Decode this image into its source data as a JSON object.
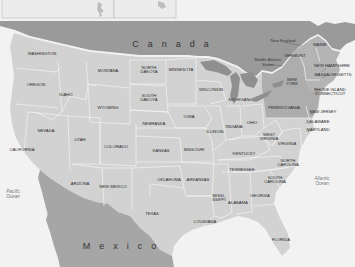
{
  "map": {
    "colors": {
      "water": "#f2f2f2",
      "canada": "#9a9a9a",
      "mexico": "#a6a6a6",
      "state": "#d2d2d2",
      "state_alt": "#c6c6c6",
      "new_england": "#b4b4b4",
      "middle_atlantic": "#adadad",
      "great_lakes": "#8f8f8f",
      "border": "#f4f4f4",
      "inset_bg": "#ececec",
      "inset_border": "#b8b8b8"
    },
    "countries": {
      "canada": "Canada",
      "mexico": "Mexico"
    },
    "oceans": {
      "pacific": "Pacific\nOcean",
      "atlantic": "Atlantic\nOcean"
    },
    "regions": {
      "new_england": "New England",
      "middle_atlantic": "Middle Atlantic\nStates"
    },
    "states": [
      {
        "name": "WASHINGTON",
        "x": 42,
        "y": 54
      },
      {
        "name": "OREGON",
        "x": 36,
        "y": 85
      },
      {
        "name": "IDAHO",
        "x": 66,
        "y": 95
      },
      {
        "name": "MONTANA",
        "x": 108,
        "y": 71
      },
      {
        "name": "WYOMING",
        "x": 108,
        "y": 108
      },
      {
        "name": "NEVADA",
        "x": 46,
        "y": 131
      },
      {
        "name": "UTAH",
        "x": 80,
        "y": 140
      },
      {
        "name": "COLORADO",
        "x": 116,
        "y": 147
      },
      {
        "name": "CALIFORNIA",
        "x": 22,
        "y": 150
      },
      {
        "name": "ARIZONA",
        "x": 80,
        "y": 184
      },
      {
        "name": "NEW MEXICO",
        "x": 113,
        "y": 187
      },
      {
        "name": "NORTH\nDAKOTA",
        "x": 149,
        "y": 70
      },
      {
        "name": "SOUTH\nDAKOTA",
        "x": 149,
        "y": 98
      },
      {
        "name": "NEBRASKA",
        "x": 154,
        "y": 124
      },
      {
        "name": "KANSAS",
        "x": 161,
        "y": 151
      },
      {
        "name": "OKLAHOMA",
        "x": 169,
        "y": 180
      },
      {
        "name": "TEXAS",
        "x": 152,
        "y": 214
      },
      {
        "name": "MINNESOTA",
        "x": 181,
        "y": 70
      },
      {
        "name": "IOWA",
        "x": 189,
        "y": 117
      },
      {
        "name": "MISSOURI",
        "x": 194,
        "y": 150
      },
      {
        "name": "ARKANSAS",
        "x": 198,
        "y": 180
      },
      {
        "name": "LOUISIANA",
        "x": 205,
        "y": 222
      },
      {
        "name": "WISCONSIN",
        "x": 211,
        "y": 90
      },
      {
        "name": "ILLINOIS",
        "x": 215,
        "y": 132
      },
      {
        "name": "MISSI-\nSSIPPI",
        "x": 219,
        "y": 198
      },
      {
        "name": "MICHIGAN",
        "x": 239,
        "y": 100
      },
      {
        "name": "INDIANA",
        "x": 234,
        "y": 127
      },
      {
        "name": "KENTUCKY",
        "x": 244,
        "y": 154
      },
      {
        "name": "TENNESSEE",
        "x": 242,
        "y": 170
      },
      {
        "name": "ALABAMA",
        "x": 238,
        "y": 203
      },
      {
        "name": "OHIO",
        "x": 252,
        "y": 123
      },
      {
        "name": "GEORGIA",
        "x": 260,
        "y": 196
      },
      {
        "name": "FLORIDA",
        "x": 281,
        "y": 240
      },
      {
        "name": "WEST\nVIRGINIA",
        "x": 269,
        "y": 137
      },
      {
        "name": "VIRGINIA",
        "x": 287,
        "y": 144
      },
      {
        "name": "NORTH\nCAROLINA",
        "x": 288,
        "y": 163
      },
      {
        "name": "SOUTH\nCAROLINA",
        "x": 275,
        "y": 180
      },
      {
        "name": "PENNSYLVANIA",
        "x": 284,
        "y": 108
      },
      {
        "name": "NEW\nYORK",
        "x": 292,
        "y": 82
      },
      {
        "name": "VERMONT",
        "x": 295,
        "y": 56
      },
      {
        "name": "MAINE",
        "x": 320,
        "y": 45
      },
      {
        "name": "NEW HAMPSHIRE",
        "x": 332,
        "y": 66
      },
      {
        "name": "MASSACHUSETTS",
        "x": 333,
        "y": 75
      },
      {
        "name": "RHODE ISLAND\nCONNECTICUT",
        "x": 330,
        "y": 92
      },
      {
        "name": "NEW JERSEY",
        "x": 323,
        "y": 112
      },
      {
        "name": "DELAWARE",
        "x": 318,
        "y": 122
      },
      {
        "name": "MARYLAND",
        "x": 318,
        "y": 130
      }
    ]
  }
}
